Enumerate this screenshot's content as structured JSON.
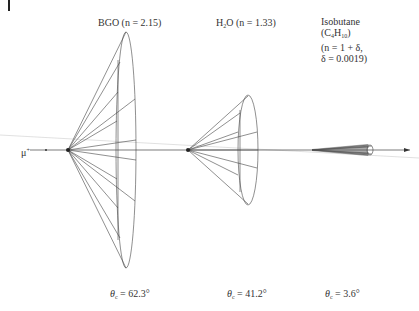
{
  "diagram": {
    "particle_label": "μ",
    "particle_charge": "+",
    "media": [
      {
        "name": "BGO",
        "label": "BGO (n = 2.15)",
        "theta_label": "θ",
        "theta_sub": "c",
        "theta_value": " = 62.3°"
      },
      {
        "name": "H2O",
        "label_pre": "H",
        "label_sub": "2",
        "label_post": "O (n = 1.33)",
        "theta_label": "θ",
        "theta_sub": "c",
        "theta_value": " = 41.2°"
      },
      {
        "name": "Isobutane",
        "line1": "Isobutane",
        "line2_pre": "(C",
        "line2_sub1": "4",
        "line2_mid": "H",
        "line2_sub2": "10",
        "line2_post": ")",
        "line3": "(n = 1 + δ,",
        "line4": "δ = 0.0019)",
        "theta_label": "θ",
        "theta_sub": "c",
        "theta_value": " = 3.6°"
      }
    ]
  }
}
